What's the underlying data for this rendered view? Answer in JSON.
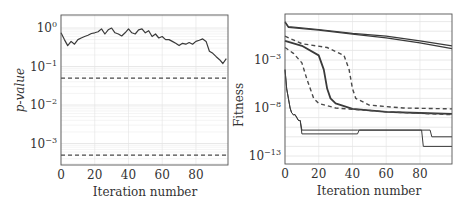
{
  "chart_data": [
    {
      "type": "line",
      "title": "",
      "xlabel": "Iteration number",
      "ylabel": "p-value",
      "yscale": "log",
      "xlim": [
        0,
        99
      ],
      "ylim": [
        0.00025,
        2
      ],
      "grid": true,
      "x_ticks": [
        "0",
        "20",
        "40",
        "60",
        "80"
      ],
      "y_ticks": [
        "10^0",
        "10^-1",
        "10^-2",
        "10^-3"
      ],
      "series": [
        {
          "name": "p-value",
          "style": "solid",
          "x": [
            0,
            2,
            4,
            6,
            8,
            10,
            12,
            14,
            16,
            18,
            20,
            22,
            24,
            26,
            28,
            30,
            32,
            34,
            36,
            38,
            40,
            42,
            44,
            46,
            48,
            50,
            52,
            54,
            56,
            58,
            60,
            62,
            64,
            66,
            68,
            70,
            72,
            74,
            76,
            78,
            80,
            82,
            84,
            86,
            88,
            90,
            92,
            94,
            96,
            98
          ],
          "values": [
            0.75,
            0.5,
            0.35,
            0.45,
            0.38,
            0.5,
            0.55,
            0.6,
            0.65,
            0.72,
            0.75,
            0.8,
            0.95,
            0.7,
            0.9,
            1.0,
            0.75,
            0.7,
            0.62,
            0.75,
            0.95,
            0.75,
            0.7,
            0.9,
            0.95,
            0.75,
            0.85,
            0.6,
            0.7,
            0.55,
            0.6,
            0.5,
            0.5,
            0.45,
            0.4,
            0.35,
            0.4,
            0.38,
            0.42,
            0.38,
            0.45,
            0.48,
            0.52,
            0.45,
            0.25,
            0.22,
            0.18,
            0.15,
            0.12,
            0.16
          ]
        },
        {
          "name": "upper threshold",
          "style": "dashed",
          "x": [
            0,
            99
          ],
          "values": [
            0.05,
            0.05
          ]
        },
        {
          "name": "lower threshold",
          "style": "dashed",
          "x": [
            0,
            99
          ],
          "values": [
            0.0005,
            0.0005
          ]
        }
      ]
    },
    {
      "type": "line",
      "title": "",
      "xlabel": "Iteration number",
      "ylabel": "Fitness",
      "yscale": "log",
      "xlim": [
        0,
        99
      ],
      "ylim": [
        1e-14,
        60
      ],
      "grid": true,
      "x_ticks": [
        "0",
        "20",
        "40",
        "60",
        "80"
      ],
      "y_ticks": [
        "10^-3",
        "10^-8",
        "10^-13"
      ],
      "series": [
        {
          "name": "slow A",
          "style": "solid",
          "x": [
            0,
            2,
            20,
            40,
            60,
            80,
            99
          ],
          "values": [
            10,
            3,
            1.5,
            0.6,
            0.3,
            0.1,
            0.03
          ]
        },
        {
          "name": "slow B",
          "style": "solid",
          "x": [
            0,
            2,
            20,
            40,
            60,
            80,
            99
          ],
          "values": [
            8,
            2.5,
            1.3,
            0.5,
            0.2,
            0.06,
            0.015
          ]
        },
        {
          "name": "median",
          "style": "solid-thick",
          "x": [
            0,
            10,
            20,
            23,
            25,
            27,
            30,
            40,
            60,
            80,
            99
          ],
          "values": [
            0.1,
            0.03,
            0.003,
            0.0001,
            1e-06,
            1e-07,
            3e-08,
            8e-09,
            4e-09,
            3e-09,
            2.5e-09
          ]
        },
        {
          "name": "upper quartile",
          "style": "dashed",
          "x": [
            0,
            10,
            25,
            35,
            38,
            40,
            42,
            50,
            70,
            99
          ],
          "values": [
            0.3,
            0.05,
            0.02,
            0.003,
            0.0001,
            1e-06,
            1e-07,
            2e-08,
            1e-08,
            8e-09
          ]
        },
        {
          "name": "lower quartile",
          "style": "dashed",
          "x": [
            0,
            5,
            10,
            13,
            15,
            17,
            20,
            30,
            60,
            99
          ],
          "values": [
            0.02,
            0.005,
            0.0005,
            1e-05,
            1e-06,
            1e-07,
            3e-08,
            1e-08,
            4e-09,
            2e-09
          ]
        },
        {
          "name": "best A",
          "style": "solid-thin",
          "x": [
            0,
            1,
            2,
            3,
            4,
            5,
            6,
            8,
            9,
            10,
            43,
            44,
            86,
            87,
            99
          ],
          "values": [
            0.0001,
            1e-06,
            1e-07,
            1e-08,
            3e-09,
            2e-09,
            2e-09,
            5e-10,
            5e-10,
            5e-11,
            5e-11,
            5e-11,
            5e-11,
            1e-11,
            1e-11
          ]
        },
        {
          "name": "best B",
          "style": "solid-thin",
          "x": [
            0,
            1,
            2,
            3,
            4,
            5,
            6,
            8,
            9,
            10,
            43,
            44,
            81,
            82,
            99
          ],
          "values": [
            0.0001,
            1e-06,
            1e-07,
            1e-08,
            3e-09,
            2e-09,
            2e-09,
            5e-10,
            5e-10,
            2e-11,
            2e-11,
            5e-11,
            5e-11,
            1e-12,
            1e-12
          ]
        }
      ]
    }
  ]
}
